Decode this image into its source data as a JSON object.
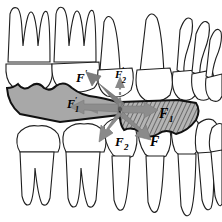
{
  "figure": {
    "type": "dental-biomechanics-diagram",
    "background_color": "#ffffff",
    "stroke_color": "#1a1a1a",
    "wedge_fill_left": "#a8a8a8",
    "wedge_fill_right": "#b0b0b0",
    "arrow_fill": "#8c8c8c",
    "arrow_fill_dark": "#6f6f6f",
    "width": 222,
    "height": 222
  },
  "labels": [
    {
      "id": "F-prime",
      "base": "F",
      "prime": "′",
      "sub": "",
      "x": 76,
      "y": 82,
      "size": 13
    },
    {
      "id": "F-prime-2",
      "base": "F",
      "prime": "′",
      "sub": "2",
      "x": 118,
      "y": 78,
      "size": 11
    },
    {
      "id": "F-prime-1",
      "base": "F",
      "prime": "′",
      "sub": "1",
      "x": 69,
      "y": 108,
      "size": 12
    },
    {
      "id": "F-1",
      "base": "F",
      "prime": "",
      "sub": "1",
      "x": 160,
      "y": 117,
      "size": 14
    },
    {
      "id": "F-2",
      "base": "F",
      "prime": "",
      "sub": "2",
      "x": 117,
      "y": 146,
      "size": 13
    },
    {
      "id": "F",
      "base": "F",
      "prime": "",
      "sub": "",
      "x": 152,
      "y": 145,
      "size": 14
    }
  ],
  "arrows": [
    {
      "id": "arrow-F-prime",
      "style": "solid",
      "direction": "up-left",
      "label_ref": "F-prime"
    },
    {
      "id": "arrow-F-prime-2",
      "style": "dashed",
      "direction": "up",
      "label_ref": "F-prime-2"
    },
    {
      "id": "arrow-F-prime-1",
      "style": "dashed",
      "direction": "left",
      "label_ref": "F-prime-1"
    },
    {
      "id": "arrow-F-1",
      "style": "solid",
      "direction": "right",
      "label_ref": "F-1"
    },
    {
      "id": "arrow-F-2",
      "style": "solid",
      "direction": "down-left",
      "label_ref": "F-2"
    },
    {
      "id": "arrow-F",
      "style": "solid",
      "direction": "down-right",
      "label_ref": "F"
    }
  ],
  "regions": [
    {
      "id": "left-wedge",
      "fill": "solid-gray",
      "description": "upper-left occlusal wedge"
    },
    {
      "id": "right-wedge",
      "fill": "hatched",
      "description": "lower-right occlusal wedge"
    }
  ],
  "teeth": {
    "upper_left_molars": 2,
    "upper_right_premolars_canines": 4,
    "lower_left_molars": 2,
    "lower_right_premolars_canines": 4
  }
}
